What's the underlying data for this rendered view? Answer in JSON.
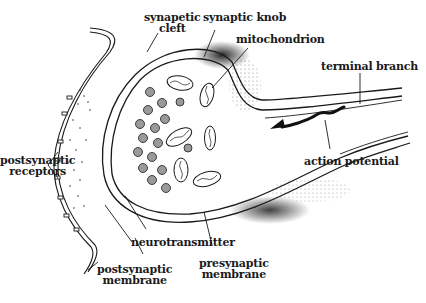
{
  "figure": {
    "labels": {
      "synaptic_cleft": [
        "synapetic",
        "cleft"
      ],
      "synaptic_knob": "synaptic knob",
      "mitochondrion": "mitochondrion",
      "terminal_branch": "terminal branch",
      "postsynaptic_receptors": [
        "postsynaptic",
        "receptors"
      ],
      "action_potential": "action potential",
      "neurotransmitter": "neurotransmitter",
      "postsynaptic_membrane": [
        "postsynaptic",
        "membrane"
      ],
      "presynaptic_membrane": [
        "presynaptic",
        "membrane"
      ]
    },
    "colors": {
      "ink": "#1a1a1a",
      "background": "#ffffff",
      "vesicle_fill": "#9a9a9a"
    }
  }
}
